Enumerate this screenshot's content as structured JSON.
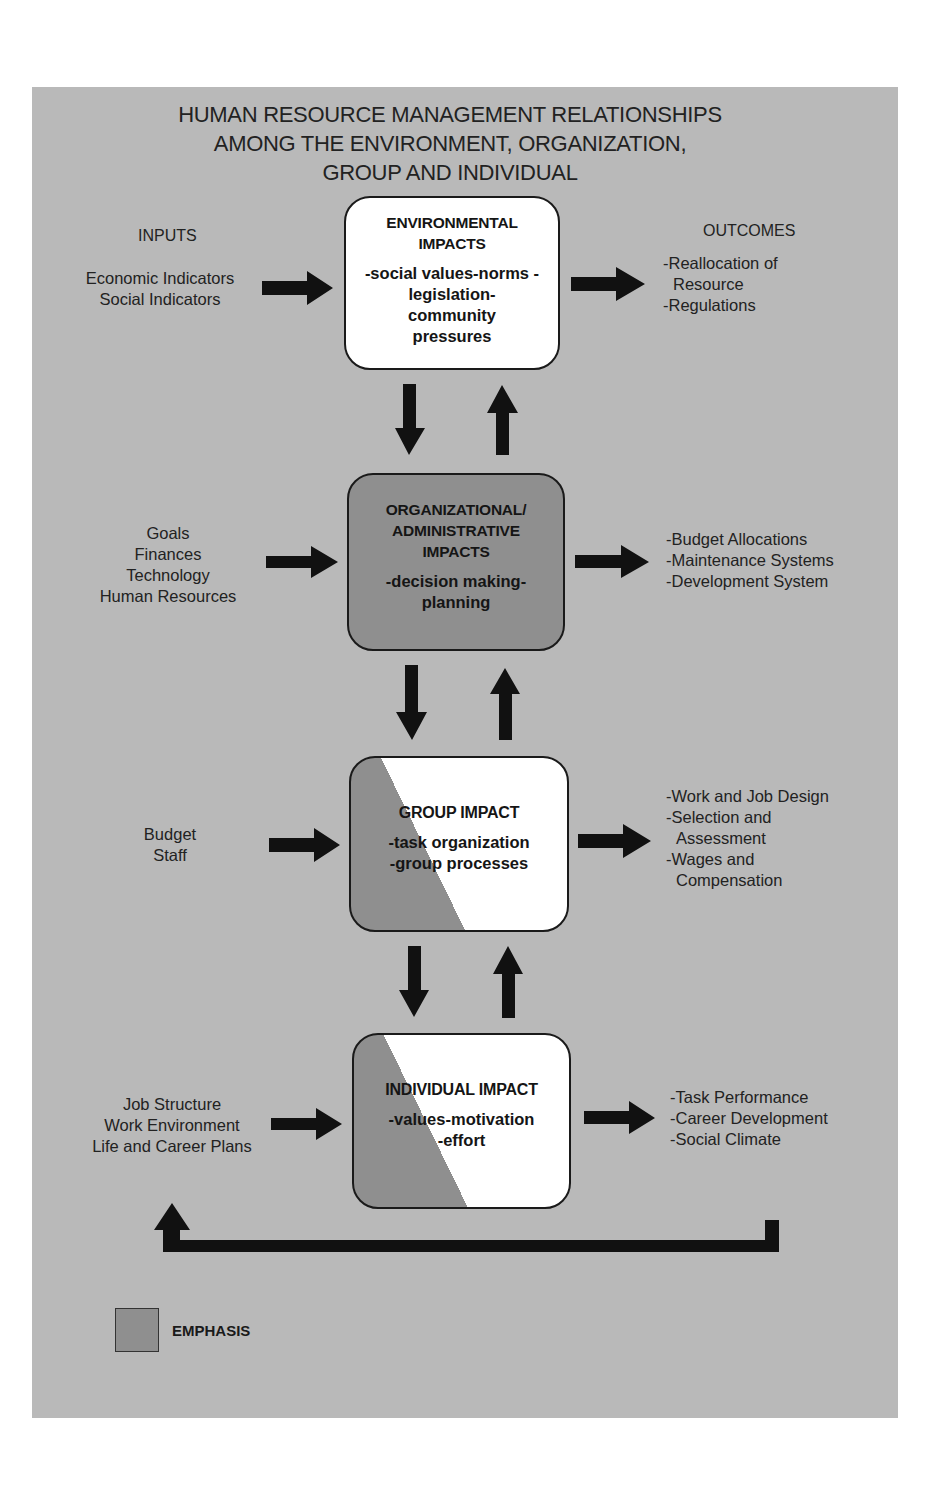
{
  "title": {
    "lines": [
      "HUMAN RESOURCE MANAGEMENT RELATIONSHIPS",
      "AMONG THE ENVIRONMENT, ORGANIZATION,",
      "GROUP AND INDIVIDUAL"
    ]
  },
  "columns": {
    "inputs_label": "INPUTS",
    "outcomes_label": "OUTCOMES"
  },
  "colors": {
    "panel_background": "#b9b9b9",
    "emphasis_fill": "#8f8f8f",
    "box_white": "#ffffff",
    "arrow": "#111111"
  },
  "levels": [
    {
      "id": "environmental",
      "emphasis": "none",
      "heading": [
        "ENVIRONMENTAL",
        "IMPACTS"
      ],
      "body": [
        "-social values-norms -",
        "legislation-",
        "community",
        "pressures"
      ],
      "inputs": [
        "Economic Indicators",
        "Social Indicators"
      ],
      "outcomes": [
        "-Reallocation of",
        "Resource",
        "-Regulations"
      ]
    },
    {
      "id": "organizational",
      "emphasis": "full",
      "heading": [
        "ORGANIZATIONAL/",
        "ADMINISTRATIVE",
        "IMPACTS"
      ],
      "body": [
        "-decision making-",
        "planning"
      ],
      "inputs": [
        "Goals",
        "Finances",
        "Technology",
        "Human Resources"
      ],
      "outcomes": [
        "-Budget Allocations",
        "-Maintenance Systems",
        "-Development System"
      ]
    },
    {
      "id": "group",
      "emphasis": "partial",
      "heading": [
        "GROUP IMPACT"
      ],
      "body": [
        "-task organization",
        "-group processes"
      ],
      "inputs": [
        "Budget",
        "Staff"
      ],
      "outcomes": [
        "-Work and Job Design",
        "-Selection and",
        "Assessment",
        "-Wages and",
        "Compensation"
      ]
    },
    {
      "id": "individual",
      "emphasis": "partial",
      "heading": [
        "INDIVIDUAL IMPACT"
      ],
      "body": [
        "-values-motivation",
        "-effort"
      ],
      "inputs": [
        "Job Structure",
        "Work Environment",
        "Life and Career Plans"
      ],
      "outcomes": [
        "-Task Performance",
        "-Career Development",
        "-Social Climate"
      ]
    }
  ],
  "feedback_loop": {
    "from": "individual outcomes",
    "to": "individual inputs",
    "direction": "right-to-left then up"
  },
  "legend": {
    "label": "EMPHASIS",
    "swatch_meaning": "grey fill indicates emphasis"
  }
}
